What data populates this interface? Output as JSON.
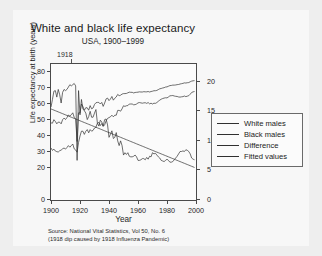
{
  "figure": {
    "title": "White and black life expectancy",
    "subtitle": "USA, 1900–1999",
    "annotation": "1918",
    "source_line1": "Source: National Vital Statistics, Vol 50, No. 6",
    "source_line2": "(1918 dip caused by 1918 Influenza Pandemic)",
    "background": "#f7f7f7",
    "line_color": "#303030"
  },
  "legend": {
    "position": "right",
    "entries": [
      {
        "label": "White males",
        "icon": "line-swatch-icon"
      },
      {
        "label": "Black males",
        "icon": "line-swatch-icon"
      },
      {
        "label": "Difference",
        "icon": "line-swatch-icon"
      },
      {
        "label": "Fitted values",
        "icon": "line-swatch-icon"
      }
    ]
  },
  "chart_data": {
    "type": "line",
    "title": "White and black life expectancy",
    "subtitle": "USA, 1900–1999",
    "xlabel": "Year",
    "ylabel": "Life expectancy at birth (years)",
    "ylabel_right": "",
    "xlim": [
      1900,
      2000
    ],
    "ylim": [
      0,
      85
    ],
    "ylim_right": [
      0,
      23
    ],
    "grid": false,
    "xticks": [
      1900,
      1920,
      1940,
      1960,
      1980,
      2000
    ],
    "yticks_left": [
      0,
      20,
      30,
      40,
      50,
      60,
      70,
      80
    ],
    "yticks_right": [
      0,
      5,
      10,
      15,
      20
    ],
    "annotations": [
      {
        "text": "1918",
        "x": 1918,
        "note": "influenza pandemic dip"
      }
    ],
    "x": [
      1900,
      1901,
      1902,
      1903,
      1904,
      1905,
      1906,
      1907,
      1908,
      1909,
      1910,
      1911,
      1912,
      1913,
      1914,
      1915,
      1916,
      1917,
      1918,
      1919,
      1920,
      1921,
      1922,
      1923,
      1924,
      1925,
      1926,
      1927,
      1928,
      1929,
      1930,
      1931,
      1932,
      1933,
      1934,
      1935,
      1936,
      1937,
      1938,
      1939,
      1940,
      1941,
      1942,
      1943,
      1944,
      1945,
      1946,
      1947,
      1948,
      1949,
      1950,
      1951,
      1952,
      1953,
      1954,
      1955,
      1956,
      1957,
      1958,
      1959,
      1960,
      1961,
      1962,
      1963,
      1964,
      1965,
      1966,
      1967,
      1968,
      1969,
      1970,
      1971,
      1972,
      1973,
      1974,
      1975,
      1976,
      1977,
      1978,
      1979,
      1980,
      1981,
      1982,
      1983,
      1984,
      1985,
      1986,
      1987,
      1988,
      1989,
      1990,
      1991,
      1992,
      1993,
      1994,
      1995,
      1996,
      1997,
      1998,
      1999
    ],
    "series": [
      {
        "name": "White males",
        "axis": "left",
        "values": [
          48.2,
          48.0,
          50.2,
          49.1,
          47.6,
          48.7,
          48.6,
          47.6,
          50.2,
          51.2,
          50.3,
          51.5,
          53.1,
          52.5,
          53.3,
          54.5,
          51.7,
          50.6,
          36.6,
          54.5,
          54.4,
          60.0,
          58.4,
          56.1,
          57.7,
          57.6,
          56.1,
          59.0,
          57.0,
          57.5,
          59.7,
          60.8,
          61.0,
          61.0,
          60.0,
          61.0,
          58.5,
          60.6,
          63.2,
          63.7,
          62.1,
          63.1,
          64.7,
          62.4,
          63.6,
          64.4,
          66.0,
          65.2,
          65.5,
          66.2,
          66.5,
          66.5,
          66.6,
          67.0,
          67.4,
          67.3,
          67.3,
          66.9,
          67.2,
          67.3,
          67.4,
          67.6,
          67.5,
          67.5,
          67.7,
          67.6,
          67.6,
          67.8,
          67.5,
          67.8,
          68.0,
          68.3,
          68.3,
          68.5,
          69.0,
          69.5,
          69.7,
          70.0,
          70.2,
          70.6,
          70.7,
          71.1,
          71.5,
          71.6,
          71.8,
          71.8,
          71.9,
          72.1,
          72.2,
          72.5,
          72.7,
          72.9,
          73.2,
          73.1,
          73.3,
          73.4,
          73.9,
          74.3,
          74.5,
          74.6
        ]
      },
      {
        "name": "Black males",
        "axis": "left",
        "values": [
          32.5,
          31.0,
          31.8,
          30.6,
          30.2,
          30.0,
          30.8,
          31.2,
          32.0,
          32.5,
          31.8,
          32.8,
          34.0,
          33.0,
          34.0,
          35.0,
          32.0,
          31.3,
          29.9,
          36.0,
          40.0,
          43.0,
          43.0,
          41.0,
          43.0,
          44.0,
          42.0,
          44.0,
          43.0,
          43.5,
          45.0,
          45.5,
          48.0,
          48.5,
          46.5,
          47.8,
          46.0,
          47.0,
          49.5,
          51.0,
          51.5,
          52.0,
          53.0,
          52.0,
          53.0,
          53.0,
          56.0,
          56.0,
          55.5,
          57.0,
          58.9,
          58.5,
          58.9,
          59.0,
          60.0,
          60.0,
          60.0,
          59.5,
          59.6,
          60.0,
          60.7,
          60.9,
          60.7,
          60.5,
          60.7,
          60.8,
          60.4,
          60.9,
          60.1,
          60.5,
          60.0,
          60.5,
          60.4,
          60.9,
          61.7,
          62.4,
          63.0,
          63.4,
          63.7,
          63.9,
          63.8,
          64.4,
          65.1,
          65.2,
          65.3,
          65.0,
          64.8,
          64.7,
          64.4,
          64.3,
          64.5,
          64.6,
          65.0,
          64.6,
          64.9,
          65.2,
          66.1,
          67.2,
          67.6,
          67.8
        ]
      },
      {
        "name": "Difference",
        "axis": "right",
        "values": [
          15.7,
          17.0,
          18.4,
          18.5,
          17.4,
          18.7,
          17.8,
          16.4,
          18.2,
          18.7,
          18.5,
          18.7,
          19.1,
          19.5,
          19.3,
          19.5,
          19.7,
          19.3,
          6.7,
          18.5,
          14.4,
          17.0,
          15.4,
          15.1,
          14.7,
          13.6,
          14.1,
          15.0,
          14.0,
          14.0,
          14.7,
          15.3,
          13.0,
          12.5,
          13.5,
          13.2,
          12.5,
          13.6,
          13.7,
          12.7,
          10.6,
          11.1,
          11.7,
          10.4,
          10.6,
          11.4,
          10.0,
          9.2,
          10.0,
          9.2,
          7.6,
          8.0,
          7.7,
          8.0,
          7.4,
          7.3,
          7.3,
          7.4,
          7.6,
          7.3,
          6.7,
          6.7,
          6.8,
          7.0,
          7.0,
          6.8,
          7.2,
          6.9,
          7.4,
          7.3,
          8.0,
          7.8,
          7.9,
          7.6,
          7.3,
          7.1,
          6.7,
          6.6,
          6.5,
          6.7,
          6.9,
          6.7,
          6.4,
          6.4,
          6.5,
          6.8,
          7.1,
          7.4,
          7.8,
          8.2,
          8.2,
          8.3,
          8.2,
          8.5,
          8.4,
          8.2,
          7.8,
          7.1,
          6.9,
          6.8
        ]
      },
      {
        "name": "Fitted values",
        "axis": "right",
        "values": [
          15.4,
          15.3,
          15.2,
          15.1,
          15.0,
          14.9,
          14.8,
          14.7,
          14.6,
          14.5,
          14.4,
          14.3,
          14.2,
          14.1,
          14.0,
          13.9,
          13.8,
          13.7,
          13.6,
          13.5,
          13.4,
          13.3,
          13.2,
          13.1,
          13.0,
          12.9,
          12.8,
          12.7,
          12.6,
          12.5,
          12.4,
          12.3,
          12.2,
          12.1,
          12.0,
          11.9,
          11.8,
          11.7,
          11.6,
          11.5,
          11.4,
          11.3,
          11.2,
          11.1,
          11.0,
          10.9,
          10.8,
          10.7,
          10.6,
          10.5,
          10.4,
          10.3,
          10.2,
          10.1,
          10.0,
          9.9,
          9.8,
          9.7,
          9.6,
          9.5,
          9.4,
          9.3,
          9.2,
          9.1,
          9.0,
          8.9,
          8.8,
          8.7,
          8.6,
          8.5,
          8.4,
          8.3,
          8.2,
          8.1,
          8.0,
          7.9,
          7.8,
          7.7,
          7.6,
          7.5,
          7.4,
          7.3,
          7.2,
          7.1,
          7.0,
          6.9,
          6.8,
          6.7,
          6.6,
          6.5,
          6.4,
          6.3,
          6.2,
          6.1,
          6.0,
          5.9,
          5.8,
          5.7,
          5.6,
          5.5
        ]
      }
    ]
  }
}
